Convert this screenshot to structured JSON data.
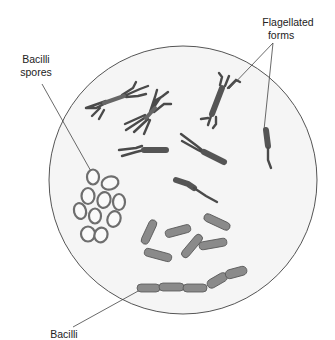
{
  "figure": {
    "type": "microscope-field-illustration",
    "colors": {
      "background": "#ffffff",
      "field_fill": "#f4f4f4",
      "field_stroke": "#555555",
      "leader_line": "#444444",
      "organism_dark": "#4a4a4a",
      "rod_fill": "#8a8a8a",
      "spore_ring": "#6e6e6e",
      "label_text": "#222222"
    },
    "labels": {
      "spores_line1": "Bacilli",
      "spores_line2": "spores",
      "flagellated_line1": "Flagellated",
      "flagellated_line2": "forms",
      "bacilli": "Bacilli"
    }
  }
}
